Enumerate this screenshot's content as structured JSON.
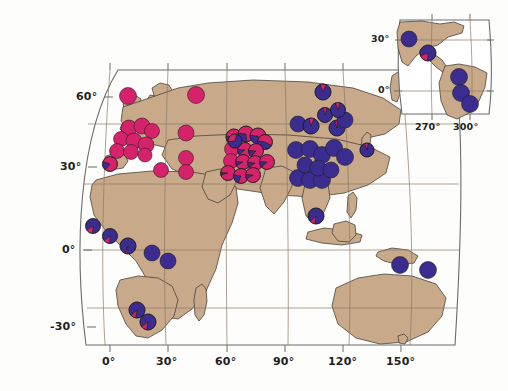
{
  "figure": {
    "kind": "world-map-pie-frequency",
    "background_color": "#ffffff",
    "land_color": "#c8a98a",
    "land_outline_color": "#4a4238",
    "graticule_color": "#8a7a63",
    "frame_color": "#6b6b6b"
  },
  "legend_colors": {
    "allele_a_color": "#d6216b",
    "allele_b_color": "#3b2d8f",
    "pie_outline": "#1a1a1a"
  },
  "main_map": {
    "name": "world-map",
    "projection": "robinson-like",
    "x_axis": {
      "label": "",
      "ticks": [
        "0°",
        "30°",
        "60°",
        "90°",
        "120°",
        "150°"
      ],
      "tick_px": [
        110,
        168,
        227,
        285,
        343,
        401
      ]
    },
    "y_axis": {
      "label": "",
      "ticks": [
        "60°",
        "30°",
        "0°",
        "-30°"
      ],
      "tick_px": [
        97,
        167,
        250,
        327
      ]
    }
  },
  "inset_map": {
    "name": "americas-inset",
    "x_axis": {
      "ticks": [
        "270°",
        "300°"
      ],
      "tick_px": [
        432,
        470
      ]
    },
    "y_axis": {
      "ticks": [
        "30°",
        "0°"
      ],
      "tick_px": [
        40,
        91
      ]
    }
  },
  "chart_data": {
    "type": "pie",
    "title": "",
    "subtitle": "",
    "xlabel": "",
    "ylabel": "",
    "series": [
      {
        "name": "allele-A",
        "color": "#d6216b"
      },
      {
        "name": "allele-B",
        "color": "#3b2d8f"
      }
    ],
    "legend_position": "none",
    "grid": true,
    "xlim": [
      -25,
      175
    ],
    "ylim": [
      -40,
      75
    ],
    "note": "values = fraction of allele-A (pink) per sampled population; remainder is allele-B (blue)",
    "points": [
      {
        "id": "p01",
        "x": 128,
        "y": 96,
        "r": 8.5,
        "a": 1.0,
        "rot": 0
      },
      {
        "id": "p02",
        "x": 196,
        "y": 95,
        "r": 8.5,
        "a": 1.0,
        "rot": 0
      },
      {
        "id": "p03",
        "x": 129,
        "y": 128,
        "r": 8.0,
        "a": 1.0,
        "rot": 0
      },
      {
        "id": "p04",
        "x": 142,
        "y": 126,
        "r": 8.0,
        "a": 1.0,
        "rot": 0
      },
      {
        "id": "p05",
        "x": 152,
        "y": 131,
        "r": 7.5,
        "a": 1.0,
        "rot": 0
      },
      {
        "id": "p06",
        "x": 121,
        "y": 139,
        "r": 7.5,
        "a": 1.0,
        "rot": 0
      },
      {
        "id": "p07",
        "x": 134,
        "y": 141,
        "r": 8.0,
        "a": 1.0,
        "rot": 0
      },
      {
        "id": "p08",
        "x": 146,
        "y": 145,
        "r": 8.0,
        "a": 1.0,
        "rot": 0
      },
      {
        "id": "p09",
        "x": 117,
        "y": 151,
        "r": 7.5,
        "a": 1.0,
        "rot": 0
      },
      {
        "id": "p10",
        "x": 131,
        "y": 152,
        "r": 7.5,
        "a": 1.0,
        "rot": 0
      },
      {
        "id": "p11",
        "x": 145,
        "y": 155,
        "r": 7.0,
        "a": 1.0,
        "rot": 0
      },
      {
        "id": "p12",
        "x": 186,
        "y": 133,
        "r": 8.0,
        "a": 1.0,
        "rot": 0
      },
      {
        "id": "p13",
        "x": 186,
        "y": 158,
        "r": 7.5,
        "a": 1.0,
        "rot": 0
      },
      {
        "id": "p14",
        "x": 161,
        "y": 170,
        "r": 7.5,
        "a": 1.0,
        "rot": 0
      },
      {
        "id": "p15",
        "x": 186,
        "y": 172,
        "r": 7.5,
        "a": 1.0,
        "rot": 0
      },
      {
        "id": "p16",
        "x": 110,
        "y": 164,
        "r": 7.5,
        "a": 0.8,
        "rot": 200
      },
      {
        "id": "p17",
        "x": 234,
        "y": 137,
        "r": 8.0,
        "a": 0.92,
        "rot": 185
      },
      {
        "id": "p18",
        "x": 246,
        "y": 134,
        "r": 8.0,
        "a": 0.72,
        "rot": 185
      },
      {
        "id": "p19",
        "x": 258,
        "y": 136,
        "r": 8.0,
        "a": 0.7,
        "rot": 185
      },
      {
        "id": "p20",
        "x": 265,
        "y": 142,
        "r": 7.5,
        "a": 0.55,
        "rot": 190
      },
      {
        "id": "p21",
        "x": 232,
        "y": 149,
        "r": 7.5,
        "a": 1.0,
        "rot": 0
      },
      {
        "id": "p22",
        "x": 245,
        "y": 150,
        "r": 7.5,
        "a": 0.88,
        "rot": 185
      },
      {
        "id": "p23",
        "x": 256,
        "y": 151,
        "r": 7.5,
        "a": 0.85,
        "rot": 185
      },
      {
        "id": "p24",
        "x": 231,
        "y": 161,
        "r": 7.5,
        "a": 1.0,
        "rot": 0
      },
      {
        "id": "p25",
        "x": 243,
        "y": 162,
        "r": 7.5,
        "a": 0.9,
        "rot": 185
      },
      {
        "id": "p26",
        "x": 255,
        "y": 163,
        "r": 7.5,
        "a": 0.88,
        "rot": 185
      },
      {
        "id": "p27",
        "x": 267,
        "y": 162,
        "r": 7.5,
        "a": 0.86,
        "rot": 185
      },
      {
        "id": "p28",
        "x": 228,
        "y": 173,
        "r": 7.5,
        "a": 0.94,
        "rot": 185
      },
      {
        "id": "p29",
        "x": 241,
        "y": 176,
        "r": 7.5,
        "a": 0.78,
        "rot": 190
      },
      {
        "id": "p30",
        "x": 253,
        "y": 175,
        "r": 7.5,
        "a": 0.9,
        "rot": 185
      },
      {
        "id": "p31",
        "x": 235,
        "y": 141,
        "r": 7.0,
        "a": 0.3,
        "rot": 175
      },
      {
        "id": "p32",
        "x": 298,
        "y": 124,
        "r": 8.0,
        "a": 0.0,
        "rot": 0
      },
      {
        "id": "p33",
        "x": 311,
        "y": 126,
        "r": 8.0,
        "a": 0.1,
        "rot": 255
      },
      {
        "id": "p34",
        "x": 325,
        "y": 115,
        "r": 7.5,
        "a": 0.08,
        "rot": 255
      },
      {
        "id": "p35",
        "x": 337,
        "y": 128,
        "r": 8.0,
        "a": 0.06,
        "rot": 255
      },
      {
        "id": "p36",
        "x": 345,
        "y": 120,
        "r": 8.0,
        "a": 0.0,
        "rot": 0
      },
      {
        "id": "p37",
        "x": 323,
        "y": 92,
        "r": 8.0,
        "a": 0.12,
        "rot": 250
      },
      {
        "id": "p38",
        "x": 338,
        "y": 110,
        "r": 7.5,
        "a": 0.1,
        "rot": 250
      },
      {
        "id": "p39",
        "x": 296,
        "y": 150,
        "r": 8.5,
        "a": 0.0,
        "rot": 0
      },
      {
        "id": "p40",
        "x": 310,
        "y": 149,
        "r": 8.5,
        "a": 0.0,
        "rot": 0
      },
      {
        "id": "p41",
        "x": 322,
        "y": 155,
        "r": 8.5,
        "a": 0.0,
        "rot": 0
      },
      {
        "id": "p42",
        "x": 334,
        "y": 148,
        "r": 8.5,
        "a": 0.0,
        "rot": 0
      },
      {
        "id": "p43",
        "x": 345,
        "y": 157,
        "r": 8.5,
        "a": 0.0,
        "rot": 0
      },
      {
        "id": "p44",
        "x": 298,
        "y": 178,
        "r": 8.5,
        "a": 0.0,
        "rot": 0
      },
      {
        "id": "p45",
        "x": 310,
        "y": 180,
        "r": 8.5,
        "a": 0.0,
        "rot": 0
      },
      {
        "id": "p46",
        "x": 322,
        "y": 180,
        "r": 8.5,
        "a": 0.0,
        "rot": 0
      },
      {
        "id": "p47",
        "x": 305,
        "y": 165,
        "r": 8.0,
        "a": 0.0,
        "rot": 0
      },
      {
        "id": "p48",
        "x": 318,
        "y": 168,
        "r": 8.0,
        "a": 0.0,
        "rot": 0
      },
      {
        "id": "p49",
        "x": 331,
        "y": 170,
        "r": 8.0,
        "a": 0.0,
        "rot": 0
      },
      {
        "id": "p50",
        "x": 367,
        "y": 150,
        "r": 7.0,
        "a": 0.08,
        "rot": 250
      },
      {
        "id": "p51",
        "x": 316,
        "y": 216,
        "r": 8.0,
        "a": 0.1,
        "rot": 100
      },
      {
        "id": "p52",
        "x": 400,
        "y": 265,
        "r": 8.5,
        "a": 0.0,
        "rot": 0
      },
      {
        "id": "p53",
        "x": 428,
        "y": 270,
        "r": 8.5,
        "a": 0.0,
        "rot": 0
      },
      {
        "id": "p54",
        "x": 93,
        "y": 226,
        "r": 7.5,
        "a": 0.14,
        "rot": 95
      },
      {
        "id": "p55",
        "x": 110,
        "y": 236,
        "r": 7.5,
        "a": 0.12,
        "rot": 95
      },
      {
        "id": "p56",
        "x": 128,
        "y": 246,
        "r": 8.0,
        "a": 0.04,
        "rot": 95
      },
      {
        "id": "p57",
        "x": 152,
        "y": 253,
        "r": 8.0,
        "a": 0.0,
        "rot": 0
      },
      {
        "id": "p58",
        "x": 168,
        "y": 261,
        "r": 8.0,
        "a": 0.0,
        "rot": 0
      },
      {
        "id": "p59",
        "x": 137,
        "y": 310,
        "r": 8.0,
        "a": 0.1,
        "rot": 100
      },
      {
        "id": "p60",
        "x": 148,
        "y": 322,
        "r": 8.0,
        "a": 0.12,
        "rot": 100
      },
      {
        "id": "i01",
        "x": 409,
        "y": 39,
        "r": 8.0,
        "a": 0.0,
        "rot": 0
      },
      {
        "id": "i02",
        "x": 428,
        "y": 53,
        "r": 8.0,
        "a": 0.18,
        "rot": 95
      },
      {
        "id": "i03",
        "x": 459,
        "y": 77,
        "r": 8.5,
        "a": 0.0,
        "rot": 0
      },
      {
        "id": "i04",
        "x": 461,
        "y": 93,
        "r": 8.5,
        "a": 0.0,
        "rot": 0
      },
      {
        "id": "i05",
        "x": 470,
        "y": 104,
        "r": 8.5,
        "a": 0.0,
        "rot": 0
      }
    ]
  }
}
